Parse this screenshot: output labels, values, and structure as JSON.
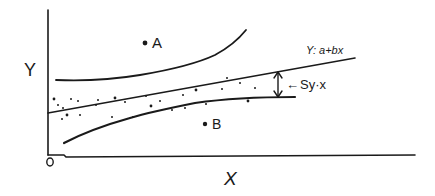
{
  "diagram": {
    "type": "regression-scatter-sketch",
    "axes": {
      "y_label": "Y",
      "x_label": "X",
      "origin_label": "0"
    },
    "regression_line": {
      "equation_label": "Y: a+bx"
    },
    "error_band": {
      "label": "Sy·x",
      "arrow_glyph": "←"
    },
    "outliers": [
      {
        "label": "A",
        "position": "above-band"
      },
      {
        "label": "B",
        "position": "below-band"
      }
    ],
    "scatter_point_count": 24
  }
}
